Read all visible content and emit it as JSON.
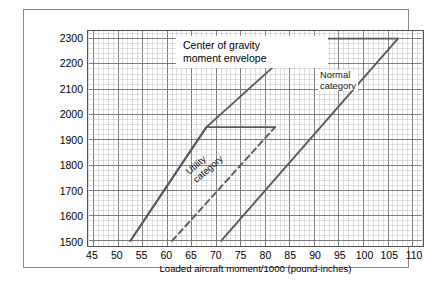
{
  "figure": {
    "title_box": {
      "line1": "Center of gravity",
      "line2": "moment envelope"
    }
  },
  "chart_data": {
    "type": "line",
    "title": "Center of gravity moment envelope",
    "xlabel": "Loaded aircraft moment/1000 (pound-inches)",
    "ylabel": "Loaded aircraft weight (pounds)",
    "xlim": [
      44,
      112
    ],
    "ylim": [
      1480,
      2330
    ],
    "xticks": [
      45,
      50,
      55,
      60,
      65,
      70,
      75,
      80,
      85,
      90,
      95,
      100,
      105,
      110
    ],
    "yticks": [
      1500,
      1600,
      1700,
      1800,
      1900,
      2000,
      2100,
      2200,
      2300
    ],
    "xtick_step_minor": 1,
    "ytick_step_minor": 20,
    "grid": "on",
    "legend": "none",
    "annotations": [
      {
        "text": "Center of gravity moment envelope",
        "x": 58,
        "y": 2290
      },
      {
        "text": "Utility category",
        "x": 64,
        "y": 1760,
        "rotation": -41
      },
      {
        "text": "Normal category",
        "x": 92,
        "y": 2225
      }
    ],
    "series": [
      {
        "name": "Utility category forward limit",
        "style": "solid",
        "color": "#5a5a5a",
        "points": [
          [
            52.5,
            1500
          ],
          [
            68.0,
            1950
          ],
          [
            82.0,
            1950
          ]
        ]
      },
      {
        "name": "Utility category aft limit",
        "style": "dashed",
        "color": "#5a5a5a",
        "points": [
          [
            61.0,
            1500
          ],
          [
            82.0,
            1950
          ]
        ]
      },
      {
        "name": "Normal category forward limit",
        "style": "solid",
        "color": "#5a5a5a",
        "points": [
          [
            52.5,
            1500
          ],
          [
            68.0,
            1950
          ],
          [
            88.0,
            2300
          ],
          [
            107.0,
            2300
          ]
        ]
      },
      {
        "name": "Normal category aft limit",
        "style": "solid",
        "color": "#5a5a5a",
        "points": [
          [
            71.0,
            1500
          ],
          [
            107.0,
            2300
          ]
        ]
      }
    ]
  }
}
